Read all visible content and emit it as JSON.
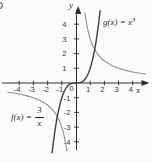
{
  "page": {
    "background": "#fbfbfb"
  },
  "colors": {
    "axis": "#2f2f2f",
    "tick_text": "#3a3a3a",
    "label_text": "#2e2e2e",
    "curve_g": "#3f3f3f",
    "curve_f": "#909090"
  },
  "labels": {
    "y_axis": "y",
    "x_axis": "x",
    "origin": "0",
    "g": {
      "prefix": "g(x) = x",
      "exponent": "3"
    },
    "f": {
      "prefix": "f(x) =",
      "numerator": "3",
      "denominator": "x"
    }
  },
  "chart_data": {
    "type": "line",
    "title": "",
    "xlabel": "x",
    "ylabel": "y",
    "xlim": [
      -4.9,
      5.2
    ],
    "ylim": [
      -4.9,
      5.1
    ],
    "grid": false,
    "legend_position": "inline-annotations",
    "x_tick_values": [
      -4,
      -3,
      -2,
      -1,
      1,
      2,
      3,
      4
    ],
    "x_tick_labels": [
      "-4",
      "-3",
      "-2",
      "-1",
      "1",
      "2",
      "3",
      "4"
    ],
    "y_tick_values": [
      4,
      3,
      2,
      1,
      -1,
      -2,
      -3,
      -4
    ],
    "y_tick_labels": [
      "4",
      "3",
      "2",
      "1",
      "-1",
      "-2",
      "-3",
      "-4"
    ],
    "origin_label": "0",
    "series": [
      {
        "name": "f",
        "legend": "f(x) = 3/x",
        "expression": "3/x",
        "color": "#909090",
        "branches": [
          [
            [
              -4.8,
              -0.625
            ],
            [
              -4.5,
              -0.667
            ],
            [
              -4.0,
              -0.75
            ],
            [
              -3.5,
              -0.857
            ],
            [
              -3.0,
              -1.0
            ],
            [
              -2.5,
              -1.2
            ],
            [
              -2.0,
              -1.5
            ],
            [
              -1.8,
              -1.667
            ],
            [
              -1.6,
              -1.875
            ],
            [
              -1.4,
              -2.143
            ],
            [
              -1.2,
              -2.5
            ],
            [
              -1.0,
              -3.0
            ],
            [
              -0.9,
              -3.333
            ],
            [
              -0.8,
              -3.75
            ],
            [
              -0.7,
              -4.286
            ],
            [
              -0.65,
              -4.615
            ]
          ],
          [
            [
              0.63,
              4.762
            ],
            [
              0.7,
              4.286
            ],
            [
              0.8,
              3.75
            ],
            [
              0.9,
              3.333
            ],
            [
              1.0,
              3.0
            ],
            [
              1.2,
              2.5
            ],
            [
              1.4,
              2.143
            ],
            [
              1.6,
              1.875
            ],
            [
              1.8,
              1.667
            ],
            [
              2.0,
              1.5
            ],
            [
              2.5,
              1.2
            ],
            [
              3.0,
              1.0
            ],
            [
              3.5,
              0.857
            ],
            [
              4.0,
              0.75
            ],
            [
              4.5,
              0.667
            ],
            [
              4.9,
              0.612
            ]
          ]
        ]
      },
      {
        "name": "g",
        "legend": "g(x) = x³",
        "expression": "x^3",
        "color": "#3f3f3f",
        "branches": [
          [
            [
              -1.68,
              -4.742
            ],
            [
              -1.6,
              -4.096
            ],
            [
              -1.5,
              -3.375
            ],
            [
              -1.4,
              -2.744
            ],
            [
              -1.3,
              -2.197
            ],
            [
              -1.2,
              -1.728
            ],
            [
              -1.1,
              -1.331
            ],
            [
              -1.0,
              -1.0
            ],
            [
              -0.9,
              -0.729
            ],
            [
              -0.8,
              -0.512
            ],
            [
              -0.7,
              -0.343
            ],
            [
              -0.6,
              -0.216
            ],
            [
              -0.5,
              -0.125
            ],
            [
              -0.4,
              -0.064
            ],
            [
              -0.3,
              -0.027
            ],
            [
              -0.2,
              -0.008
            ],
            [
              0,
              0
            ],
            [
              0.2,
              0.008
            ],
            [
              0.3,
              0.027
            ],
            [
              0.4,
              0.064
            ],
            [
              0.5,
              0.125
            ],
            [
              0.6,
              0.216
            ],
            [
              0.7,
              0.343
            ],
            [
              0.8,
              0.512
            ],
            [
              0.9,
              0.729
            ],
            [
              1.0,
              1.0
            ],
            [
              1.1,
              1.331
            ],
            [
              1.2,
              1.728
            ],
            [
              1.3,
              2.197
            ],
            [
              1.4,
              2.744
            ],
            [
              1.5,
              3.375
            ],
            [
              1.6,
              4.096
            ],
            [
              1.7,
              4.913
            ]
          ]
        ]
      }
    ]
  }
}
